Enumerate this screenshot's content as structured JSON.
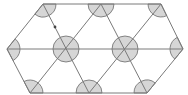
{
  "diagram": {
    "type": "triangular-lattice-hexagon",
    "colors": {
      "background": "#ffffff",
      "line": "#7a7a7a",
      "sector_fill": "#d6d6d6",
      "sector_stroke": "#6a6a6a",
      "dot": "#444444"
    },
    "sector_radius": 13,
    "vertices": {
      "top": [
        [
          43,
          4
        ],
        [
          101,
          4
        ],
        [
          161,
          4
        ]
      ],
      "middle": [
        [
          7,
          49
        ],
        [
          66,
          49
        ],
        [
          125,
          49
        ],
        [
          183,
          49
        ]
      ],
      "bottom": [
        [
          30,
          93
        ],
        [
          89,
          93
        ],
        [
          147,
          93
        ]
      ]
    },
    "segments": [
      [
        [
          43,
          4
        ],
        [
          161,
          4
        ]
      ],
      [
        [
          30,
          93
        ],
        [
          147,
          93
        ]
      ],
      [
        [
          7,
          49
        ],
        [
          183,
          49
        ]
      ],
      [
        [
          7,
          49
        ],
        [
          43,
          4
        ]
      ],
      [
        [
          7,
          49
        ],
        [
          30,
          93
        ]
      ],
      [
        [
          161,
          4
        ],
        [
          183,
          49
        ]
      ],
      [
        [
          183,
          49
        ],
        [
          147,
          93
        ]
      ],
      [
        [
          43,
          4
        ],
        [
          89,
          93
        ]
      ],
      [
        [
          101,
          4
        ],
        [
          30,
          93
        ]
      ],
      [
        [
          101,
          4
        ],
        [
          147,
          93
        ]
      ],
      [
        [
          161,
          4
        ],
        [
          89,
          93
        ]
      ]
    ],
    "full_circles": [
      [
        66,
        49
      ],
      [
        125,
        49
      ]
    ],
    "marker_dot": [
      55,
      27
    ]
  }
}
